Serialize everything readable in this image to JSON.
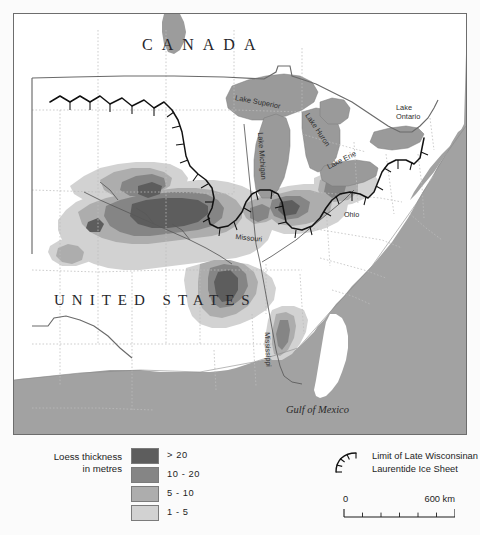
{
  "map": {
    "countries": [
      {
        "name": "canada-label",
        "text": "CANADA"
      },
      {
        "name": "united-states-label",
        "text": "UNITED STATES"
      }
    ],
    "lakes": [
      {
        "name": "lake-superior-label",
        "text": "Lake Superior"
      },
      {
        "name": "lake-michigan-label",
        "text": "Lake Michigan"
      },
      {
        "name": "lake-huron-label",
        "text": "Lake Huron"
      },
      {
        "name": "lake-erie-label",
        "text": "Lake Erie"
      },
      {
        "name": "lake-ontario-label",
        "line1": "Lake",
        "line2": "Ontario"
      }
    ],
    "rivers": [
      {
        "name": "missouri-river-label",
        "text": "Missouri"
      },
      {
        "name": "ohio-river-label",
        "text": "Ohio"
      },
      {
        "name": "mississippi-river-label",
        "text": "Mississippi"
      }
    ],
    "water_bodies": [
      {
        "name": "gulf-of-mexico-label",
        "text": "Gulf of Mexico"
      }
    ],
    "colors": {
      "ocean": "#a2a2a2",
      "land": "#ffffff",
      "lake_fill": "#9a9a9a",
      "frame": "#6d6d6d",
      "state_border": "#b8b8b8",
      "country_border": "#6a6a6a",
      "ice_limit": "#111111",
      "river": "#5b5b5b"
    }
  },
  "legend": {
    "title_line1": "Loess thickness",
    "title_line2": "in metres",
    "classes": [
      {
        "label": "> 20",
        "color": "#5d5d5d"
      },
      {
        "label": "10 - 20",
        "color": "#858585"
      },
      {
        "label": "5 - 10",
        "color": "#adadad"
      },
      {
        "label": "1 - 5",
        "color": "#d2d2d2"
      }
    ]
  },
  "ice_key": {
    "line1": "Limit of Late Wisconsinan",
    "line2": "Laurentide Ice Sheet"
  },
  "scalebar": {
    "zero": "0",
    "max": "600 km",
    "segments": 6
  }
}
